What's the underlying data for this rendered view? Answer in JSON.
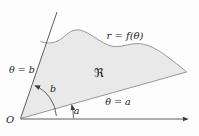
{
  "figure": {
    "type": "polar-area-region-diagram",
    "background": "#fdfdfd",
    "region_fill": "#e9e9e9",
    "line_color": "#4a4a4a",
    "curve_color": "#8c8c8c",
    "text_color": "#1c1c1c",
    "labels": {
      "curve": "r = f(θ)",
      "region": "ℜ",
      "ray_b": "θ = b",
      "ray_a": "θ = a",
      "angle_b": "b",
      "angle_a": "a",
      "origin": "O"
    }
  }
}
